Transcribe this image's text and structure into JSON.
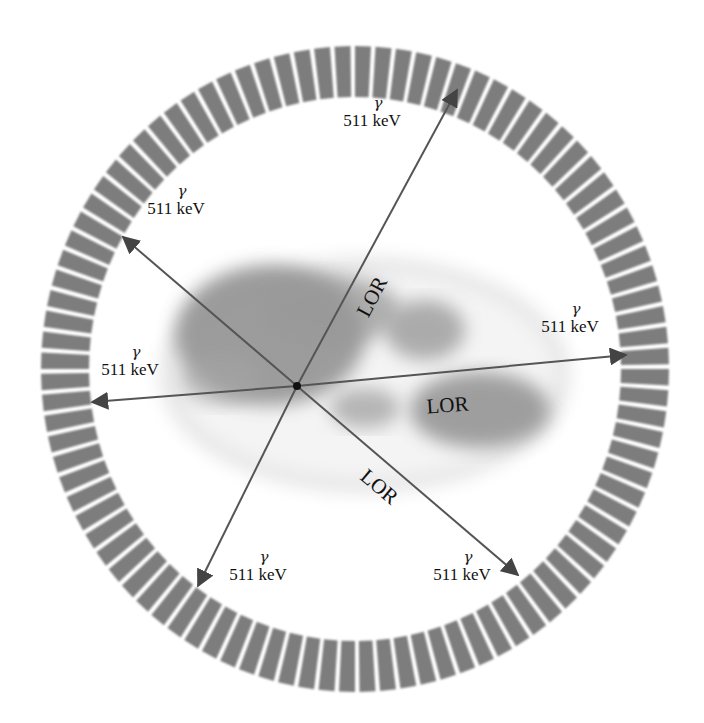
{
  "diagram": {
    "type": "PET detector ring with coincidence lines of response",
    "ring": {
      "center": [
        355,
        369
      ],
      "outer_radius": [
        314,
        323
      ],
      "inner_radius": [
        266,
        272
      ],
      "segments": 96,
      "segment_color": "#7d7d7d"
    },
    "annihilation_point": [
      297,
      386
    ],
    "body_color": "#8f8f8f",
    "arrow_color": "#555555",
    "photons": [
      {
        "id": "p1",
        "gamma": "γ",
        "energy": "511 keV",
        "tip": [
          457,
          90
        ],
        "label_pos": [
          372,
          124
        ]
      },
      {
        "id": "p2",
        "gamma": "γ",
        "energy": "511 keV",
        "tip": [
          123,
          237
        ],
        "label_pos": [
          176,
          212
        ]
      },
      {
        "id": "p3",
        "gamma": "γ",
        "energy": "511 keV",
        "tip": [
          626,
          355
        ],
        "label_pos": [
          570,
          330
        ]
      },
      {
        "id": "p4",
        "gamma": "γ",
        "energy": "511 keV",
        "tip": [
          92,
          402
        ],
        "label_pos": [
          130,
          373
        ]
      },
      {
        "id": "p5",
        "gamma": "γ",
        "energy": "511 keV",
        "tip": [
          198,
          586
        ],
        "label_pos": [
          258,
          578
        ]
      },
      {
        "id": "p6",
        "gamma": "γ",
        "energy": "511 keV",
        "tip": [
          518,
          575
        ],
        "label_pos": [
          462,
          578
        ]
      }
    ],
    "lor_labels": [
      {
        "text": "LOR",
        "x": 378,
        "y": 300,
        "rotate": -62
      },
      {
        "text": "LOR",
        "x": 448,
        "y": 412,
        "rotate": -4
      },
      {
        "text": "LOR",
        "x": 375,
        "y": 492,
        "rotate": 40
      }
    ]
  }
}
